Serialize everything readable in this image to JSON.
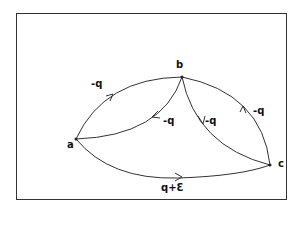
{
  "diagram": {
    "nodes": [
      {
        "id": "a",
        "label": "a"
      },
      {
        "id": "b",
        "label": "b"
      },
      {
        "id": "c",
        "label": "c"
      }
    ],
    "edges": [
      {
        "from": "a",
        "to": "b",
        "label": "-q",
        "route": "upper arc"
      },
      {
        "from": "b",
        "to": "a",
        "label": "-q",
        "route": "inner arc"
      },
      {
        "from": "b",
        "to": "c",
        "label": "-q",
        "route": "inner arc"
      },
      {
        "from": "c",
        "to": "b",
        "label": "-q",
        "route": "outer arc"
      },
      {
        "from": "a",
        "to": "c",
        "label": "q+ε",
        "route": "lower arc"
      }
    ]
  },
  "labels": {
    "node_a": "a",
    "node_b": "b",
    "node_c": "c",
    "edge_ab": "-q",
    "edge_ba": "-q",
    "edge_bc": "-q",
    "edge_cb": "-q",
    "edge_ac": "q+Ɛ"
  },
  "colors": {
    "stroke": "#333333",
    "background": "#ffffff"
  }
}
